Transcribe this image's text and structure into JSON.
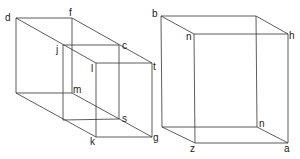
{
  "figure": {
    "type": "wireframe-boxes",
    "line_color": "#333333",
    "boxes": [
      {
        "name": "left-box",
        "labels": {
          "d": "d",
          "f": "f",
          "j": "j",
          "c": "c",
          "l": "l",
          "t": "t",
          "m": "m",
          "s": "s",
          "k": "k",
          "g": "g"
        }
      },
      {
        "name": "right-box",
        "labels": {
          "b": "b",
          "n_top": "n",
          "h": "h",
          "n_bottom": "n",
          "z": "z",
          "a": "a"
        }
      }
    ]
  }
}
